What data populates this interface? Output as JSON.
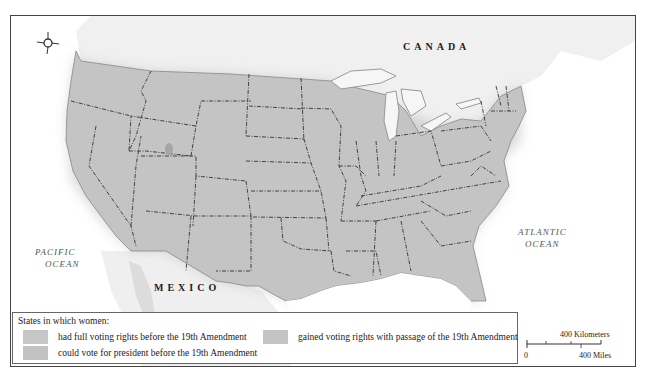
{
  "map": {
    "labels": {
      "canada": "CANADA",
      "mexico": "MEXICO",
      "pacific_ocean_line1": "PACIFIC",
      "pacific_ocean_line2": "OCEAN",
      "atlantic_ocean_line1": "ATLANTIC",
      "atlantic_ocean_line2": "OCEAN"
    },
    "compass": {
      "n": "N",
      "s": "S",
      "e": "E",
      "w": "W"
    },
    "colors": {
      "state_fill": "#c4c4c4",
      "foreign_land": "#efefef",
      "water": "#ffffff",
      "lakes": "#f4f4f4",
      "border": "#333333",
      "frame": "#444444"
    }
  },
  "legend": {
    "title": "States in which women:",
    "items": [
      {
        "label": "had full voting rights before the 19th Amendment",
        "color": "#c6c6c6"
      },
      {
        "label": "could vote for president before the 19th Amendment",
        "color": "#c2c2c2"
      },
      {
        "label": "gained voting rights with passage of the 19th Amendment",
        "color": "#c4c4c4"
      }
    ]
  },
  "scale": {
    "kilometers": "400 Kilometers",
    "miles": "400 Miles",
    "zero": "0"
  }
}
